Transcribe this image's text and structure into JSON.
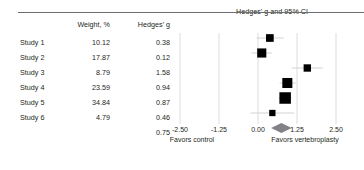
{
  "chart_data": {
    "type": "forest",
    "title": "Hedges' g and 95% CI",
    "xlabel_left": "Favors control",
    "xlabel_right": "Favors vertebroplasty",
    "ylabel": "",
    "xlim": [
      -2.5,
      2.5
    ],
    "xticks": [
      "-2.50",
      "-1.25",
      "0.00",
      "1.25",
      "2.50"
    ],
    "xtick_values": [
      -2.5,
      -1.25,
      0,
      1.25,
      2.5
    ],
    "grid": true,
    "legend": "none",
    "columns": [
      "",
      "Weight, %",
      "Hedges' g"
    ],
    "rows": [
      {
        "study": "Study 1",
        "weight": "10.12",
        "g": "0.38",
        "g_value": 0.38,
        "ci_low": -0.05,
        "ci_high": 0.82,
        "weight_value": 10.12
      },
      {
        "study": "Study 2",
        "weight": "17.87",
        "g": "0.12",
        "g_value": 0.12,
        "ci_low": -0.21,
        "ci_high": 0.45,
        "weight_value": 17.87
      },
      {
        "study": "Study 3",
        "weight": "8.79",
        "g": "1.58",
        "g_value": 1.58,
        "ci_low": 1.08,
        "ci_high": 2.08,
        "weight_value": 8.79
      },
      {
        "study": "Study 4",
        "weight": "23.59",
        "g": "0.94",
        "g_value": 0.94,
        "ci_low": 0.69,
        "ci_high": 1.21,
        "weight_value": 23.59
      },
      {
        "study": "Study 5",
        "weight": "34.84",
        "g": "0.87",
        "g_value": 0.87,
        "ci_low": 0.66,
        "ci_high": 1.08,
        "weight_value": 34.84
      },
      {
        "study": "Study 6",
        "weight": "4.79",
        "g": "0.46",
        "g_value": 0.46,
        "ci_low": -0.24,
        "ci_high": 1.16,
        "weight_value": 4.79
      }
    ],
    "summary": {
      "study": "",
      "weight": "",
      "g": "0.75",
      "g_value": 0.75,
      "ci_low": 0.42,
      "ci_high": 1.08
    }
  },
  "colors": {
    "marker": "#000000",
    "summary": "#808285",
    "grid": "#d1d3d4",
    "rule": "#6d6e71",
    "text": "#231f20",
    "background": "#ffffff"
  }
}
